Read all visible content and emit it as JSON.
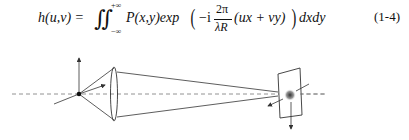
{
  "equation": {
    "lhs": "h(u,v) =",
    "integral": "∬",
    "upper_limit": "+∞",
    "lower_limit": "−∞",
    "integrand": "P(x,y)exp",
    "minus_i": "−i",
    "frac_num": "2π",
    "frac_den": "λR",
    "argument": "(ux + vy)",
    "differential": "dxdy",
    "number": "(1-4)"
  },
  "diagram": {
    "colors": {
      "line": "#333333",
      "axis": "#777777",
      "spot": "#444444"
    },
    "elements": [
      "optical-axis",
      "point-source",
      "object-axes",
      "lens",
      "light-cone",
      "screen",
      "image-spot",
      "screen-axes"
    ]
  }
}
